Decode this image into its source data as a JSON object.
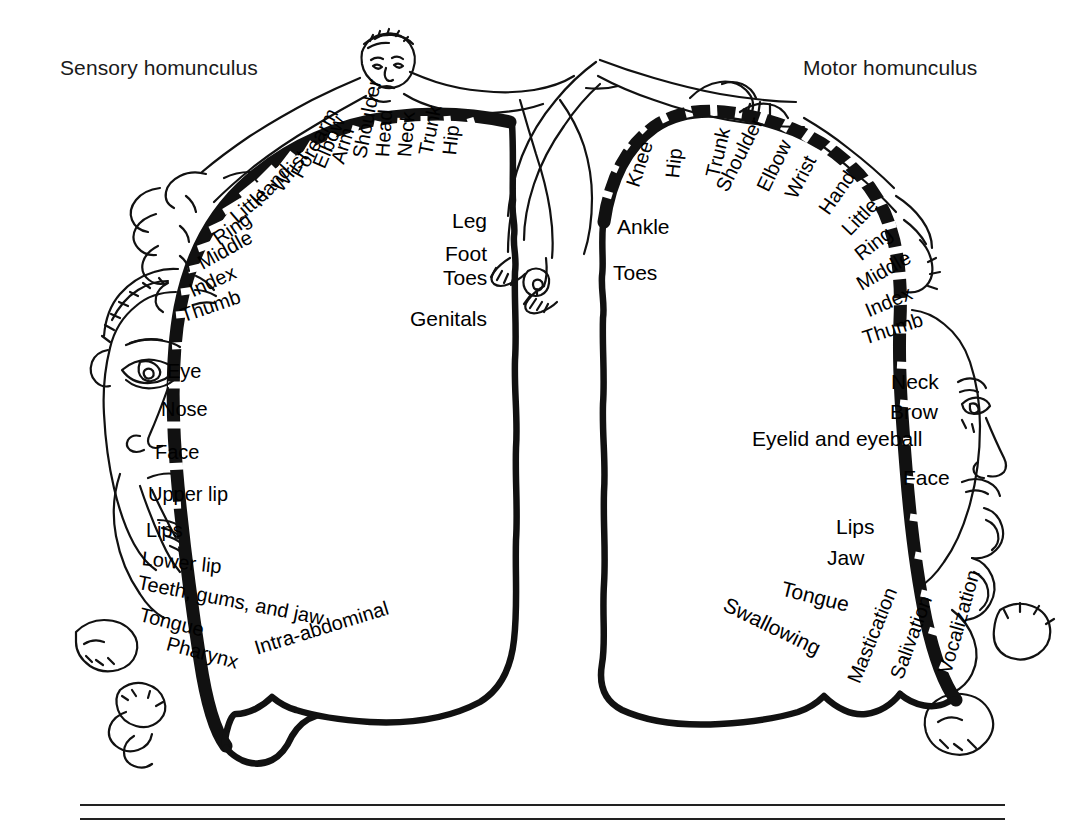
{
  "figure": {
    "type": "anatomical-diagram",
    "background_color": "#ffffff",
    "ink_color": "#000000"
  },
  "titles": {
    "sensory": "Sensory homunculus",
    "motor": "Motor homunculus"
  },
  "footer_rules": {
    "count": 2,
    "x_start": 80,
    "x_end": 1005,
    "y_first": 805,
    "y_second": 819
  },
  "sensory_map": {
    "name": "Sensory homunculus",
    "hemisphere_side": "left",
    "labels": [
      {
        "text": "Hip",
        "x": 449,
        "y": 155,
        "rot": -84,
        "size": 20
      },
      {
        "text": "Trunk",
        "x": 425,
        "y": 155,
        "rot": -79,
        "size": 20
      },
      {
        "text": "Neck",
        "x": 404,
        "y": 157,
        "rot": -85,
        "size": 20
      },
      {
        "text": "Head",
        "x": 382,
        "y": 157,
        "rot": -86,
        "size": 20
      },
      {
        "text": "Shoulder",
        "x": 359,
        "y": 158,
        "rot": -79,
        "size": 20
      },
      {
        "text": "Arm",
        "x": 337,
        "y": 163,
        "rot": -73,
        "size": 20
      },
      {
        "text": "Elbow",
        "x": 318,
        "y": 167,
        "rot": -67,
        "size": 20
      },
      {
        "text": "Forearm",
        "x": 296,
        "y": 176,
        "rot": -61,
        "size": 20
      },
      {
        "text": "Wrist",
        "x": 276,
        "y": 189,
        "rot": -53,
        "size": 20
      },
      {
        "text": "Hand",
        "x": 255,
        "y": 203,
        "rot": -48,
        "size": 20
      },
      {
        "text": "Little",
        "x": 233,
        "y": 219,
        "rot": -41,
        "size": 20
      },
      {
        "text": "Ring",
        "x": 215,
        "y": 240,
        "rot": -35,
        "size": 20
      },
      {
        "text": "Middle",
        "x": 199,
        "y": 264,
        "rot": -29,
        "size": 20
      },
      {
        "text": "Index",
        "x": 190,
        "y": 291,
        "rot": -24,
        "size": 20
      },
      {
        "text": "Thumb",
        "x": 181,
        "y": 316,
        "rot": -19,
        "size": 20
      },
      {
        "text": "Eye",
        "x": 167,
        "y": 371,
        "rot": 0,
        "size": 20
      },
      {
        "text": "Nose",
        "x": 161,
        "y": 409,
        "rot": 0,
        "size": 20
      },
      {
        "text": "Face",
        "x": 155,
        "y": 452,
        "rot": 0,
        "size": 20
      },
      {
        "text": "Upper lip",
        "x": 148,
        "y": 494,
        "rot": 0,
        "size": 20
      },
      {
        "text": "Lips",
        "x": 146,
        "y": 530,
        "rot": 0,
        "size": 20
      },
      {
        "text": "Lower lip",
        "x": 142,
        "y": 558,
        "rot": 6,
        "size": 20
      },
      {
        "text": "Teeth, gums, and jaw",
        "x": 138,
        "y": 582,
        "rot": 11,
        "size": 20
      },
      {
        "text": "Tongue",
        "x": 140,
        "y": 614,
        "rot": 14,
        "size": 20
      },
      {
        "text": "Pharynx",
        "x": 167,
        "y": 643,
        "rot": 15,
        "size": 20
      },
      {
        "text": "Leg",
        "x": 452,
        "y": 220,
        "rot": 0,
        "size": 21
      },
      {
        "text": "Foot",
        "x": 445,
        "y": 253,
        "rot": 0,
        "size": 21
      },
      {
        "text": "Toes",
        "x": 443,
        "y": 277,
        "rot": 0,
        "size": 21
      },
      {
        "text": "Genitals",
        "x": 410,
        "y": 318,
        "rot": 0,
        "size": 21
      },
      {
        "text": "Intra-abdominal",
        "x": 255,
        "y": 648,
        "rot": -17,
        "size": 20
      }
    ]
  },
  "motor_map": {
    "name": "Motor homunculus",
    "hemisphere_side": "right",
    "labels": [
      {
        "text": "Knee",
        "x": 632,
        "y": 186,
        "rot": -72,
        "size": 20
      },
      {
        "text": "Hip",
        "x": 672,
        "y": 178,
        "rot": -84,
        "size": 20
      },
      {
        "text": "Trunk",
        "x": 712,
        "y": 177,
        "rot": -77,
        "size": 20
      },
      {
        "text": "Shoulder",
        "x": 721,
        "y": 190,
        "rot": -63,
        "size": 20
      },
      {
        "text": "Elbow",
        "x": 762,
        "y": 190,
        "rot": -64,
        "size": 20
      },
      {
        "text": "Wrist",
        "x": 790,
        "y": 197,
        "rot": -63,
        "size": 20
      },
      {
        "text": "Hand",
        "x": 823,
        "y": 212,
        "rot": -55,
        "size": 20
      },
      {
        "text": "Little",
        "x": 845,
        "y": 232,
        "rot": -46,
        "size": 20
      },
      {
        "text": "Ring",
        "x": 857,
        "y": 256,
        "rot": -38,
        "size": 20
      },
      {
        "text": "Middle",
        "x": 858,
        "y": 285,
        "rot": -30,
        "size": 20
      },
      {
        "text": "Index",
        "x": 866,
        "y": 311,
        "rot": -23,
        "size": 20
      },
      {
        "text": "Thumb",
        "x": 863,
        "y": 338,
        "rot": -18,
        "size": 20
      },
      {
        "text": "Ankle",
        "x": 617,
        "y": 226,
        "rot": 0,
        "size": 21
      },
      {
        "text": "Toes",
        "x": 613,
        "y": 272,
        "rot": 0,
        "size": 21
      },
      {
        "text": "Neck",
        "x": 891,
        "y": 381,
        "rot": 0,
        "size": 21
      },
      {
        "text": "Brow",
        "x": 890,
        "y": 411,
        "rot": 0,
        "size": 21
      },
      {
        "text": "Eyelid and eyeball",
        "x": 752,
        "y": 438,
        "rot": 0,
        "size": 21
      },
      {
        "text": "Face",
        "x": 903,
        "y": 477,
        "rot": 0,
        "size": 21
      },
      {
        "text": "Lips",
        "x": 836,
        "y": 526,
        "rot": 0,
        "size": 21
      },
      {
        "text": "Jaw",
        "x": 827,
        "y": 557,
        "rot": 0,
        "size": 21
      },
      {
        "text": "Tongue",
        "x": 782,
        "y": 588,
        "rot": 14,
        "size": 21
      },
      {
        "text": "Swallowing",
        "x": 725,
        "y": 603,
        "rot": 26,
        "size": 21
      },
      {
        "text": "Mastication",
        "x": 853,
        "y": 682,
        "rot": -68,
        "size": 20
      },
      {
        "text": "Salivation",
        "x": 896,
        "y": 678,
        "rot": -70,
        "size": 20
      },
      {
        "text": "Vocalization",
        "x": 944,
        "y": 673,
        "rot": -74,
        "size": 20
      }
    ]
  }
}
